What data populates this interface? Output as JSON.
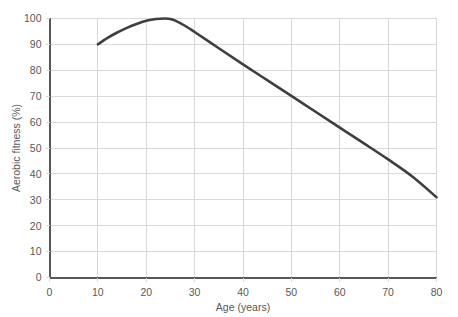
{
  "chart_data": {
    "type": "line",
    "title": "",
    "xlabel": "Age (years)",
    "ylabel": "Aerobic fitness (%)",
    "xlim": [
      0,
      80
    ],
    "ylim": [
      0,
      100
    ],
    "xticks": [
      0,
      10,
      20,
      30,
      40,
      50,
      60,
      70,
      80
    ],
    "yticks": [
      0,
      10,
      20,
      30,
      40,
      50,
      60,
      70,
      80,
      90,
      100
    ],
    "xtick_labels": [
      "0",
      "10",
      "20",
      "30",
      "40",
      "50",
      "60",
      "70",
      "80"
    ],
    "ytick_labels": [
      "0",
      "10",
      "20",
      "30",
      "40",
      "50",
      "60",
      "70",
      "80",
      "90",
      "100"
    ],
    "grid": true,
    "legend": false,
    "line_color": "#3f3f41",
    "grid_color": "#d9d9db",
    "axis_color": "#58585a",
    "series": [
      {
        "name": "Aerobic fitness",
        "x": [
          10,
          12,
          14,
          16,
          18,
          20,
          22,
          24,
          25,
          26,
          28,
          30,
          35,
          40,
          45,
          50,
          55,
          60,
          65,
          70,
          75,
          80
        ],
        "values": [
          90,
          92.5,
          94.6,
          96.4,
          97.9,
          99.1,
          99.8,
          100,
          99.8,
          99.2,
          97.2,
          94.8,
          88.5,
          82.3,
          76.2,
          70.1,
          64.0,
          57.9,
          51.8,
          45.6,
          39.0,
          31.0
        ]
      }
    ],
    "annotations": {
      "peak_age": 24,
      "peak_value": 100,
      "start_age": 10,
      "start_value": 90,
      "end_age": 80,
      "end_value": 31
    }
  }
}
